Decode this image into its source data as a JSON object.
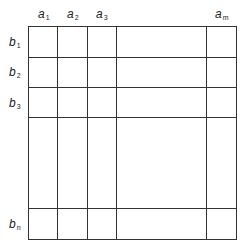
{
  "diagram": {
    "type": "matrix-grid",
    "column_labels": [
      {
        "base": "a",
        "sub": "1"
      },
      {
        "base": "a",
        "sub": "2"
      },
      {
        "base": "a",
        "sub": "3"
      },
      {
        "base": "a",
        "sub": "m"
      }
    ],
    "row_labels": [
      {
        "base": "b",
        "sub": "1"
      },
      {
        "base": "b",
        "sub": "2"
      },
      {
        "base": "b",
        "sub": "3"
      },
      {
        "base": "b",
        "sub": "n"
      }
    ],
    "line_color": "#333333"
  }
}
